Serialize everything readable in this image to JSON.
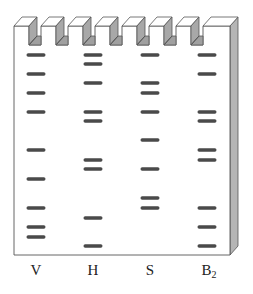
{
  "figure": {
    "type": "gel-electrophoresis",
    "colors": {
      "gel_face": "#ffffff",
      "gel_outline": "#555555",
      "side_panel": "#b5b5b5",
      "tooth_side": "#a8a8a8",
      "tooth_top": "#ffffff",
      "well_floor": "#a0a0a0",
      "band": "#4a4a4a",
      "label": "#222222"
    },
    "geometry": {
      "gel_left": 14,
      "gel_right": 230,
      "gel_top": 26,
      "gel_bottom": 255,
      "depth_dx": 8,
      "depth_dy": -9,
      "well_bottom": 45,
      "band_width": 19,
      "band_height": 3.4
    },
    "lanes": [
      {
        "id": "V",
        "label": "V",
        "label_sub": "",
        "center_x": 36,
        "bands_y": [
          55,
          74,
          93,
          112,
          150,
          179,
          208,
          227,
          237
        ]
      },
      {
        "id": "H",
        "label": "H",
        "label_sub": "",
        "center_x": 93,
        "bands_y": [
          55,
          64,
          83,
          112,
          121,
          160,
          169,
          218,
          246
        ]
      },
      {
        "id": "S",
        "label": "S",
        "label_sub": "",
        "center_x": 150,
        "bands_y": [
          55,
          83,
          93,
          112,
          140,
          169,
          198,
          208
        ]
      },
      {
        "id": "B2",
        "label": "B",
        "label_sub": "2",
        "center_x": 207,
        "bands_y": [
          55,
          74,
          112,
          121,
          150,
          160,
          208,
          227,
          246
        ]
      }
    ]
  }
}
